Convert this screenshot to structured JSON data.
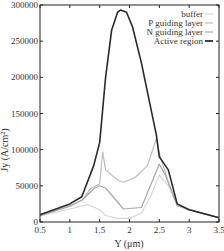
{
  "chart_data": {
    "type": "line",
    "title": "",
    "xlabel": "Y (μm)",
    "ylabel": "Jy (A/cm²)",
    "xlim": [
      0.5,
      3.5
    ],
    "ylim": [
      0,
      300000
    ],
    "xticks": [
      "0.5",
      "1",
      "1.5",
      "2",
      "2.5",
      "3",
      "3.5"
    ],
    "yticks": [
      "0",
      "50000",
      "100000",
      "150000",
      "200000",
      "250000",
      "300000"
    ],
    "grid": false,
    "legend_position": "upper right",
    "series": [
      {
        "name": "buffer",
        "color": "#d8d8d8",
        "x": [
          0.5,
          1.0,
          1.3,
          1.5,
          1.6,
          1.8,
          2.0,
          2.2,
          2.35,
          2.5,
          2.65,
          2.8,
          3.0,
          3.5
        ],
        "y": [
          8000,
          18000,
          24000,
          17000,
          9000,
          5000,
          5000,
          12000,
          35000,
          65000,
          50000,
          22000,
          17000,
          6000
        ]
      },
      {
        "name": "P guiding layer",
        "color": "#bdbdbd",
        "x": [
          0.5,
          1.0,
          1.2,
          1.35,
          1.5,
          1.55,
          1.6,
          1.8,
          1.9,
          2.1,
          2.3,
          2.45,
          2.5,
          2.65,
          2.8,
          3.0,
          3.5
        ],
        "y": [
          9000,
          22000,
          30000,
          46000,
          53000,
          97000,
          72000,
          58000,
          55000,
          62000,
          78000,
          115000,
          95000,
          55000,
          23000,
          17000,
          6000
        ]
      },
      {
        "name": "N guiding layer",
        "color": "#a8a8a8",
        "x": [
          0.5,
          1.0,
          1.2,
          1.4,
          1.5,
          1.6,
          1.9,
          2.2,
          2.4,
          2.5,
          2.6,
          2.8,
          3.0,
          3.5
        ],
        "y": [
          9000,
          22000,
          30000,
          46000,
          50000,
          47000,
          18000,
          20000,
          60000,
          80000,
          65000,
          24000,
          17000,
          6000
        ]
      },
      {
        "name": "Active region",
        "color": "#2a2a2a",
        "x": [
          0.5,
          1.0,
          1.2,
          1.4,
          1.5,
          1.6,
          1.7,
          1.8,
          1.85,
          1.95,
          2.05,
          2.2,
          2.35,
          2.45,
          2.5,
          2.65,
          2.8,
          3.0,
          3.5
        ],
        "y": [
          10000,
          25000,
          35000,
          78000,
          110000,
          200000,
          265000,
          290000,
          293000,
          290000,
          270000,
          220000,
          160000,
          120000,
          90000,
          72000,
          25000,
          17000,
          6000
        ]
      }
    ]
  },
  "legend": {
    "items": [
      "buffer",
      "P guiding layer",
      "N guiding layer",
      "Active region"
    ]
  },
  "axes": {
    "xlabel": "Y (μm)",
    "ylabel": "Jy (A/cm²)"
  }
}
